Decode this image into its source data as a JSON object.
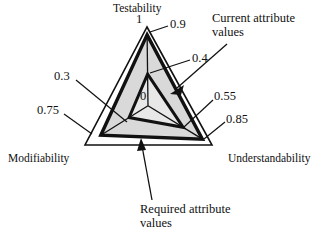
{
  "figure": {
    "type": "kiviat-radar-diagram",
    "background_color": "#ffffff",
    "line_color": "#111111"
  },
  "chart_data": {
    "type": "radar",
    "title": "",
    "subtitle": "",
    "xlabel": "",
    "ylabel": "",
    "grid": false,
    "legend_position": "annotations",
    "axes": [
      "Testability",
      "Modifiability",
      "Understandability"
    ],
    "axis_max": 1,
    "axis_min": 0,
    "center_tick_label": "0",
    "outer_tick_label": "1",
    "series": [
      {
        "name": "Required attribute values",
        "values": [
          0.9,
          0.75,
          0.85
        ],
        "value_labels": [
          "0.9",
          "0.75",
          "0.85"
        ],
        "fill": "#d9d9d9",
        "stroke": "#111111"
      },
      {
        "name": "Current attribute values",
        "values": [
          0.4,
          0.3,
          0.55
        ],
        "value_labels": [
          "0.4",
          "0.3",
          "0.55"
        ],
        "fill": "#e8e8e8",
        "stroke": "#111111"
      }
    ],
    "annotations": [
      "Current attribute values",
      "Required attribute values"
    ]
  },
  "labels": {
    "axis_testability": "Testability",
    "axis_modifiability": "Modifiability",
    "axis_understandability": "Understandability",
    "tick_outer_testability": "1",
    "tick_required_testability": "0.9",
    "tick_current_testability": "0.4",
    "tick_center": "0",
    "tick_current_modifiability": "0.3",
    "tick_required_modifiability": "0.75",
    "tick_current_understandability": "0.55",
    "tick_required_understandability": "0.85"
  },
  "annotations": {
    "current_line1": "Current attribute",
    "current_line2": "values",
    "required_line1": "Required attribute",
    "required_line2": "values"
  }
}
